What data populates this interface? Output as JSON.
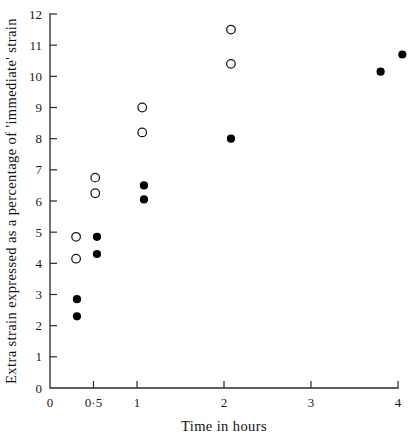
{
  "chart_data": {
    "type": "scatter",
    "title": "",
    "xlabel": "Time in hours",
    "ylabel": "Extra strain expressed as a percentage of 'immediate' strain",
    "xlim": [
      0,
      4
    ],
    "ylim": [
      0,
      12
    ],
    "grid": false,
    "legend": "none",
    "x_ticks": [
      {
        "value": 0,
        "label": "0"
      },
      {
        "value": 0.5,
        "label": "0·5"
      },
      {
        "value": 1,
        "label": "1"
      },
      {
        "value": 2,
        "label": "2"
      },
      {
        "value": 3,
        "label": "3"
      },
      {
        "value": 4,
        "label": "4"
      }
    ],
    "y_ticks": [
      {
        "value": 0,
        "label": "0"
      },
      {
        "value": 1,
        "label": "1"
      },
      {
        "value": 2,
        "label": "2"
      },
      {
        "value": 3,
        "label": "3"
      },
      {
        "value": 4,
        "label": "4"
      },
      {
        "value": 5,
        "label": "5"
      },
      {
        "value": 6,
        "label": "6"
      },
      {
        "value": 7,
        "label": "7"
      },
      {
        "value": 8,
        "label": "8"
      },
      {
        "value": 9,
        "label": "9"
      },
      {
        "value": 10,
        "label": "10"
      },
      {
        "value": 11,
        "label": "11"
      },
      {
        "value": 12,
        "label": "12"
      }
    ],
    "series": [
      {
        "name": "open-circles",
        "marker": "open-circle",
        "color": "#ffffff",
        "edge_color": "#1a1a1a",
        "points": [
          {
            "x": 0.3,
            "y": 4.85
          },
          {
            "x": 0.3,
            "y": 4.15
          },
          {
            "x": 0.52,
            "y": 6.75
          },
          {
            "x": 0.52,
            "y": 6.25
          },
          {
            "x": 1.06,
            "y": 9.0
          },
          {
            "x": 1.06,
            "y": 8.2
          },
          {
            "x": 2.08,
            "y": 11.5
          },
          {
            "x": 2.08,
            "y": 10.4
          }
        ]
      },
      {
        "name": "filled-circles",
        "marker": "filled-circle",
        "color": "#000000",
        "edge_color": "#000000",
        "points": [
          {
            "x": 0.31,
            "y": 2.85
          },
          {
            "x": 0.31,
            "y": 2.3
          },
          {
            "x": 0.54,
            "y": 4.85
          },
          {
            "x": 0.54,
            "y": 4.3
          },
          {
            "x": 1.08,
            "y": 6.5
          },
          {
            "x": 1.08,
            "y": 6.05
          },
          {
            "x": 2.08,
            "y": 8.0
          },
          {
            "x": 3.8,
            "y": 10.15
          },
          {
            "x": 4.05,
            "y": 10.7
          }
        ]
      }
    ]
  }
}
